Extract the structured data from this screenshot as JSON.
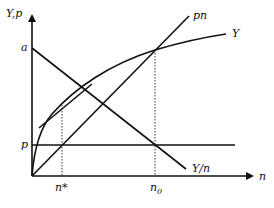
{
  "diagram": {
    "axes": {
      "y_label": "Y,p",
      "x_label": "n"
    },
    "ticks": {
      "a_label": "a",
      "p_label": "p",
      "n_star_label": "n*",
      "n0_label": "n",
      "n0_sub": "0"
    },
    "curves": {
      "output_label": "Y",
      "pn_label": "pn",
      "avg_label": "Y/n"
    },
    "colors": {
      "ink": "#111111",
      "background": "#ffffff"
    }
  }
}
